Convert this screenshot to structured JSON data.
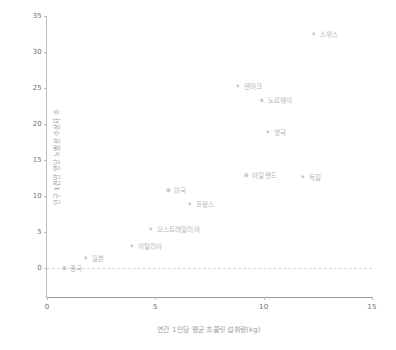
{
  "chart_data": {
    "type": "scatter",
    "title": "",
    "xlabel": "연간 1인당 평균 초콜릿 섭취량(kg)",
    "ylabel": "인구 1천만 명당 노벨상 수상자 수",
    "xlim": [
      0,
      15
    ],
    "ylim": [
      -4,
      35
    ],
    "xticks": [
      "0",
      "5",
      "10",
      "15"
    ],
    "xtick_values": [
      0,
      5,
      10,
      15
    ],
    "yticks": [
      "0",
      "5",
      "10",
      "15",
      "20",
      "25",
      "30",
      "35"
    ],
    "ytick_values": [
      0,
      5,
      10,
      15,
      20,
      25,
      30,
      35
    ],
    "grid": false,
    "legend": "none",
    "zero_reference_line": true,
    "point_color": "#cfc6d6",
    "label_color": "#b9b2c0",
    "axis_color": "#b9b9bd",
    "points": [
      {
        "label": "중국",
        "x": 0.8,
        "y": 0.0,
        "label_side": "right"
      },
      {
        "label": "일본",
        "x": 1.8,
        "y": 1.4,
        "label_side": "right"
      },
      {
        "label": "이탈리아",
        "x": 3.9,
        "y": 3.1,
        "label_side": "right"
      },
      {
        "label": "오스트레일리아",
        "x": 4.8,
        "y": 5.5,
        "label_side": "right"
      },
      {
        "label": "미국",
        "x": 5.6,
        "y": 10.8,
        "label_side": "right"
      },
      {
        "label": "프랑스",
        "x": 6.6,
        "y": 8.9,
        "label_side": "right"
      },
      {
        "label": "아일랜드",
        "x": 9.2,
        "y": 12.9,
        "label_side": "right"
      },
      {
        "label": "독일",
        "x": 11.8,
        "y": 12.7,
        "label_side": "right"
      },
      {
        "label": "영국",
        "x": 10.2,
        "y": 18.9,
        "label_side": "right"
      },
      {
        "label": "노르웨이",
        "x": 9.9,
        "y": 23.3,
        "label_side": "right"
      },
      {
        "label": "덴마크",
        "x": 8.8,
        "y": 25.3,
        "label_side": "right"
      },
      {
        "label": "스위스",
        "x": 12.3,
        "y": 32.5,
        "label_side": "right"
      }
    ]
  }
}
